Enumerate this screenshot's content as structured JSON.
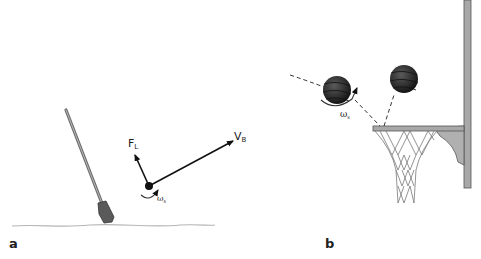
{
  "panels": [
    {
      "id": "a",
      "label": "a",
      "description": "Golf club striking ball with force and velocity vectors",
      "labels": {
        "lift_force": "F",
        "lift_force_sub": "L",
        "velocity": "V",
        "velocity_sub": "B",
        "spin": "ω",
        "spin_sub": "s"
      }
    },
    {
      "id": "b",
      "label": "b",
      "description": "Basketball with backspin bouncing off rim toward hoop",
      "labels": {
        "spin": "ω",
        "spin_sub": "s"
      }
    }
  ],
  "colors": {
    "line": "#111111",
    "ground": "#b0b0b0",
    "club": "#7a7a7a",
    "ball": "#2e2e2e",
    "rim": "#9a9a9a",
    "pole": "#a0a0a0"
  }
}
